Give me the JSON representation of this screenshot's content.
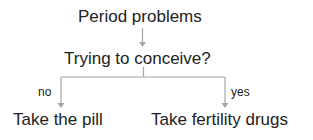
{
  "diagram": {
    "type": "decision-tree",
    "nodes": {
      "root": "Period problems",
      "question": "Trying to conceive?",
      "no_outcome": "Take the pill",
      "yes_outcome": "Take fertility drugs"
    },
    "edge_labels": {
      "no": "no",
      "yes": "yes"
    },
    "colors": {
      "text": "#222222",
      "connector": "#a6a6a6"
    }
  }
}
